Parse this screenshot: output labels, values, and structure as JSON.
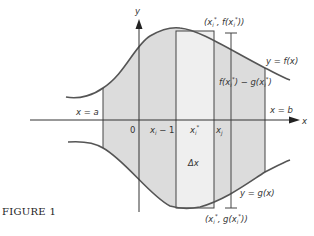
{
  "figure": {
    "caption": "FIGURE 1",
    "axes": {
      "x_label": "x",
      "y_label": "y",
      "origin_label": "0"
    },
    "bounds": {
      "left": "x = a",
      "right": "x = b"
    },
    "ticks": {
      "left": "x",
      "left_sub": "i",
      "left_tail": " − 1",
      "mid": "x",
      "mid_sub": "i",
      "mid_sup": "*",
      "right": "x",
      "right_sub": "j"
    },
    "curves": {
      "upper": "y = f(x)",
      "lower": "y = g(x)"
    },
    "rectangle": {
      "width_label": "Δx"
    },
    "points": {
      "top": "(x",
      "top_sub": "i",
      "top_sup": "*",
      "top_mid": ", f(x",
      "top_end": "))",
      "bottom": "(x",
      "bottom_mid": ", g(x",
      "bottom_end": "))"
    },
    "height_label": {
      "a": "f(x",
      "b": ") − g(x",
      "c": ")"
    },
    "colors": {
      "shade": "#dcdcdc",
      "rect": "#efefef",
      "stroke": "#444444"
    }
  }
}
